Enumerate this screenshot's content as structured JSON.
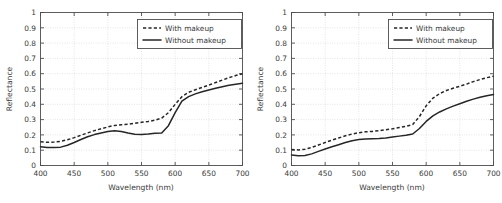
{
  "figure": {
    "panels": [
      "left-panel",
      "right-panel"
    ]
  },
  "axes": {
    "xlabel": "Wavelength (nm)",
    "ylabel": "Reflectance",
    "xticks": [
      "400",
      "450",
      "500",
      "550",
      "600",
      "650",
      "700"
    ],
    "yticks": [
      "0",
      "0.1",
      "0.2",
      "0.3",
      "0.4",
      "0.5",
      "0.6",
      "0.7",
      "0.8",
      "0.9",
      "1"
    ]
  },
  "legend": {
    "with_makeup": "With makeup",
    "without_makeup": "Without makeup"
  },
  "colors": {
    "curve": "#262626",
    "frame": "#4d4d4d",
    "grid": "#c9c9c9",
    "background": "#ffffff"
  },
  "chart_data": [
    {
      "id": "left-panel",
      "type": "line",
      "title": "",
      "xlabel": "Wavelength (nm)",
      "ylabel": "Reflectance",
      "xlim": [
        400,
        700
      ],
      "ylim": [
        0,
        1
      ],
      "xticks": [
        400,
        450,
        500,
        550,
        600,
        650,
        700
      ],
      "yticks": [
        0,
        0.1,
        0.2,
        0.3,
        0.4,
        0.5,
        0.6,
        0.7,
        0.8,
        0.9,
        1
      ],
      "grid": true,
      "legend_position": "upper right",
      "x": [
        400,
        410,
        420,
        430,
        440,
        450,
        460,
        470,
        480,
        490,
        500,
        510,
        520,
        530,
        540,
        550,
        560,
        570,
        580,
        590,
        600,
        610,
        620,
        630,
        640,
        650,
        660,
        670,
        680,
        690,
        700
      ],
      "series": [
        {
          "name": "With makeup",
          "style": "dashed",
          "values": [
            0.155,
            0.152,
            0.153,
            0.158,
            0.168,
            0.182,
            0.198,
            0.213,
            0.228,
            0.24,
            0.252,
            0.262,
            0.266,
            0.27,
            0.276,
            0.282,
            0.288,
            0.296,
            0.31,
            0.345,
            0.4,
            0.45,
            0.478,
            0.495,
            0.51,
            0.525,
            0.542,
            0.558,
            0.574,
            0.588,
            0.6
          ]
        },
        {
          "name": "Without makeup",
          "style": "solid",
          "values": [
            0.122,
            0.118,
            0.117,
            0.12,
            0.132,
            0.15,
            0.17,
            0.188,
            0.202,
            0.213,
            0.222,
            0.227,
            0.222,
            0.212,
            0.204,
            0.203,
            0.206,
            0.211,
            0.213,
            0.26,
            0.345,
            0.42,
            0.45,
            0.468,
            0.482,
            0.494,
            0.505,
            0.515,
            0.524,
            0.531,
            0.537
          ]
        }
      ]
    },
    {
      "id": "right-panel",
      "type": "line",
      "title": "",
      "xlabel": "Wavelength (nm)",
      "ylabel": "Reflectance",
      "xlim": [
        400,
        700
      ],
      "ylim": [
        0,
        1
      ],
      "xticks": [
        400,
        450,
        500,
        550,
        600,
        650,
        700
      ],
      "yticks": [
        0,
        0.1,
        0.2,
        0.3,
        0.4,
        0.5,
        0.6,
        0.7,
        0.8,
        0.9,
        1
      ],
      "grid": true,
      "legend_position": "upper right",
      "x": [
        400,
        410,
        420,
        430,
        440,
        450,
        460,
        470,
        480,
        490,
        500,
        510,
        520,
        530,
        540,
        550,
        560,
        570,
        580,
        590,
        600,
        610,
        620,
        630,
        640,
        650,
        660,
        670,
        680,
        690,
        700
      ],
      "series": [
        {
          "name": "With makeup",
          "style": "dashed",
          "values": [
            0.104,
            0.102,
            0.106,
            0.118,
            0.134,
            0.15,
            0.166,
            0.18,
            0.194,
            0.206,
            0.214,
            0.22,
            0.223,
            0.228,
            0.234,
            0.24,
            0.248,
            0.256,
            0.268,
            0.32,
            0.39,
            0.44,
            0.47,
            0.49,
            0.505,
            0.518,
            0.532,
            0.548,
            0.562,
            0.574,
            0.584
          ]
        },
        {
          "name": "Without makeup",
          "style": "solid",
          "values": [
            0.068,
            0.064,
            0.066,
            0.076,
            0.092,
            0.108,
            0.122,
            0.136,
            0.15,
            0.162,
            0.17,
            0.174,
            0.175,
            0.176,
            0.18,
            0.186,
            0.192,
            0.198,
            0.206,
            0.242,
            0.288,
            0.324,
            0.35,
            0.37,
            0.388,
            0.404,
            0.42,
            0.434,
            0.446,
            0.456,
            0.464
          ]
        }
      ]
    }
  ]
}
